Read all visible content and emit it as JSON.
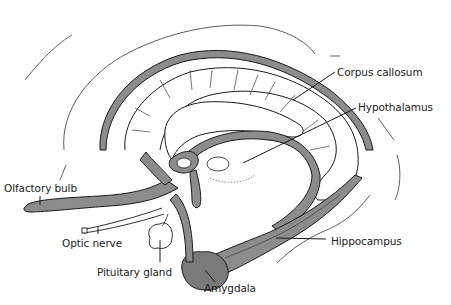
{
  "diagram": {
    "type": "anatomical line drawing",
    "colors": {
      "outline": "#1a1a1a",
      "fill": "#8c8c8c",
      "background": "#ffffff"
    },
    "labels": [
      {
        "id": "corpus-callosum",
        "text": "Corpus callosum",
        "x": 337,
        "y": 66
      },
      {
        "id": "hypothalamus",
        "text": "Hypothalamus",
        "x": 358,
        "y": 101
      },
      {
        "id": "olfactory-bulb",
        "text": "Olfactory bulb",
        "x": 4,
        "y": 182
      },
      {
        "id": "optic-nerve",
        "text": "Optic nerve",
        "x": 62,
        "y": 237
      },
      {
        "id": "hippocampus",
        "text": "Hippocampus",
        "x": 331,
        "y": 235
      },
      {
        "id": "pituitary-gland",
        "text": "Pituitary gland",
        "x": 97,
        "y": 266
      },
      {
        "id": "amygdala",
        "text": "Amygdala",
        "x": 204,
        "y": 282
      }
    ]
  }
}
